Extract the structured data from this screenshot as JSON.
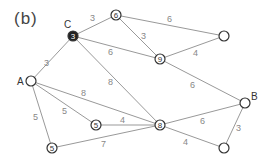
{
  "panel_label": "(b)",
  "vertex_labels": {
    "A": "A",
    "B": "B",
    "C": "C"
  },
  "nodes": {
    "C": {
      "value": "3"
    },
    "top": {
      "value": "6"
    },
    "n9": {
      "value": "9"
    },
    "n8": {
      "value": "8"
    },
    "mid5": {
      "value": "5"
    },
    "bot5": {
      "value": "5"
    }
  },
  "edges": {
    "A_C": "3",
    "C_top": "3",
    "top_rt": "6",
    "top_n9": "3",
    "C_n9": "6",
    "n9_rt": "4",
    "C_n8": "8",
    "n9_B": "6",
    "A_n8": "8",
    "A_mid5": "5",
    "A_bot5": "5",
    "mid5_n8": "4",
    "bot5_n8": "7",
    "n8_B": "6",
    "n8_br": "4",
    "B_br": "3"
  }
}
